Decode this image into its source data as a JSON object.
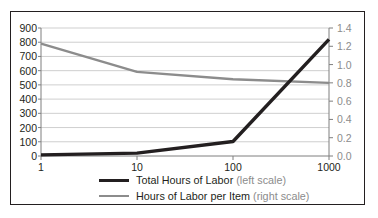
{
  "chart_data": {
    "type": "line",
    "title": "",
    "subtitle": "",
    "xlabel": "",
    "ylabel": "",
    "xscale": "log",
    "x": [
      1,
      10,
      100,
      1000
    ],
    "xtick_labels": [
      "1",
      "10",
      "100",
      "1000"
    ],
    "grid": true,
    "legend_position": "bottom",
    "left_axis": {
      "label": "",
      "ylim": [
        0,
        900
      ],
      "ticks": [
        0,
        100,
        200,
        300,
        400,
        500,
        600,
        700,
        800,
        900
      ],
      "tick_labels": [
        "0",
        "100",
        "200",
        "300",
        "400",
        "500",
        "600",
        "700",
        "800",
        "900"
      ],
      "color": "#231f20"
    },
    "right_axis": {
      "label": "",
      "ylim": [
        0.0,
        1.4
      ],
      "ticks": [
        0.0,
        0.2,
        0.4,
        0.6,
        0.8,
        1.0,
        1.2,
        1.4
      ],
      "tick_labels": [
        "0.0",
        "0.2",
        "0.4",
        "0.6",
        "0.8",
        "1.0",
        "1.2",
        "1.4"
      ],
      "color": "#8c8c8c"
    },
    "series": [
      {
        "name": "Total Hours of Labor",
        "scale_note": "(left scale)",
        "axis": "left",
        "color": "#231f20",
        "width": 3.4,
        "values": [
          8,
          20,
          102,
          820
        ]
      },
      {
        "name": "Hours of Labor per Item",
        "scale_note": "(right scale)",
        "axis": "right",
        "color": "#8c8c8c",
        "width": 2.4,
        "values": [
          1.23,
          0.92,
          0.84,
          0.8
        ]
      }
    ]
  },
  "legend": {
    "items": [
      {
        "label": "Total Hours of Labor ",
        "note": "(left scale)",
        "swatch": "black"
      },
      {
        "label": "Hours of Labor per Item ",
        "note": "(right scale)",
        "swatch": "gray"
      }
    ]
  },
  "colors": {
    "series_black": "#231f20",
    "series_gray": "#8c8c8c",
    "gridline": "#c9c9c9",
    "axis_line": "#7f7f7f",
    "frame": "#231f20",
    "background": "#ffffff"
  }
}
